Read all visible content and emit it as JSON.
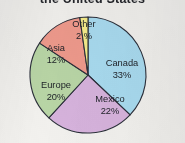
{
  "figure": {
    "title_partial": "the United States",
    "background_color": "#f2f1ee"
  },
  "chart_data": {
    "type": "pie",
    "title": "the United States",
    "xlabel": "",
    "ylabel": "",
    "categories": [
      "Canada",
      "Mexico",
      "Europe",
      "Asia",
      "Other"
    ],
    "values": [
      33,
      22,
      20,
      12,
      2
    ],
    "value_unit": "%",
    "start_angle_deg": 0,
    "direction": "clockwise",
    "legend": "none",
    "labels_inside_slices": true,
    "grid": false,
    "slices": [
      {
        "name": "Canada",
        "label": "Canada",
        "value": 33,
        "value_label": "33%",
        "color": "#a9dbf0",
        "label_x": 122,
        "label_y": 64,
        "value_x": 122,
        "value_y": 76
      },
      {
        "name": "Mexico",
        "label": "Mexico",
        "value": 22,
        "value_label": "22%",
        "color": "#d7b3dd",
        "label_x": 110,
        "label_y": 100,
        "value_x": 110,
        "value_y": 112
      },
      {
        "name": "Europe",
        "label": "Europe",
        "value": 20,
        "value_label": "20%",
        "color": "#b9d6a6",
        "label_x": 56,
        "label_y": 86,
        "value_x": 56,
        "value_y": 98
      },
      {
        "name": "Asia",
        "label": "Asia",
        "value": 12,
        "value_label": "12%",
        "color": "#ef9a8c",
        "label_x": 56,
        "label_y": 49,
        "value_x": 56,
        "value_y": 61
      },
      {
        "name": "Other",
        "label": "Other",
        "value": 2,
        "value_label": "2 %",
        "color": "#f6ed8a",
        "label_x": 84,
        "label_y": 25,
        "value_x": 84,
        "value_y": 37
      }
    ],
    "geometry": {
      "center_x": 88,
      "center_y": 75,
      "radius": 58,
      "outline_color": "#2b2f3a",
      "outline_width": 1.1
    }
  }
}
